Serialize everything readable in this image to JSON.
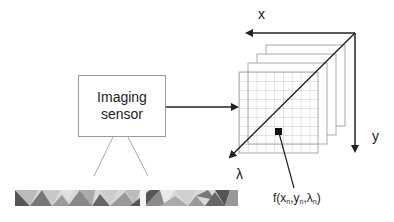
{
  "diagram": {
    "sensor": {
      "line1": "Imaging",
      "line2": "sensor"
    },
    "axes": {
      "x_label": "x",
      "y_label": "y",
      "lambda_label": "λ"
    },
    "pixel_value_label": {
      "prefix": "f(x",
      "sub1": "n",
      "mid1": ",y",
      "sub2": "n",
      "mid2": ",λ",
      "sub3": "n",
      "suffix": ")"
    },
    "cube": {
      "bands_visible": 4,
      "grid_columns": 9,
      "grid_rows": 9
    },
    "colors": {
      "line": "#222222",
      "box_border": "#9a9a9a",
      "grid": "#b0b0b0",
      "pixel": "#111111"
    },
    "ground_strip": {
      "description": "grayscale textured ground scene"
    }
  }
}
